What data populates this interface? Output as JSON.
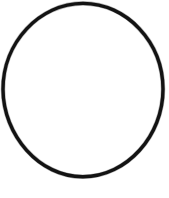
{
  "canvas": {
    "width": 169,
    "height": 198,
    "background_color": "#ffffff",
    "alt_text": "Hand-drawn black oval outline on a white background"
  },
  "shape": {
    "name": "oval",
    "type": "ellipse-outline",
    "stroke_color": "#131313",
    "fill_color": "none",
    "stroke_width_px": 3.4,
    "style": "hand-drawn",
    "center_x": 83,
    "center_y": 90,
    "radius_x": 80,
    "radius_y": 87,
    "bounds": {
      "left": 3,
      "top": 3,
      "right": 163,
      "bottom": 177
    },
    "path": "M 83 3.4 C 126.5 3.4 162.8 42.0 163.0 89.0 C 163.2 135.5 127.0 176.6 83.0 176.8 C 39.2 177.0 3.2 135.0 3.0 89.5 C 2.8 42.5 39.5 3.4 83 3.4 Z"
  }
}
